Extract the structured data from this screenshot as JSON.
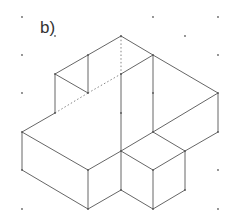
{
  "figure": {
    "label": "b)",
    "colors": {
      "edge": "#555555",
      "hidden_edge": "#777777",
      "grid_dot": "#666666",
      "background": "#ffffff"
    }
  },
  "grid_dots": [
    [
      22,
      17
    ],
    [
      153,
      17
    ],
    [
      218,
      17
    ],
    [
      55,
      36
    ],
    [
      185,
      36
    ],
    [
      22,
      55
    ],
    [
      218,
      55
    ],
    [
      22,
      93
    ],
    [
      218,
      170
    ],
    [
      22,
      209
    ],
    [
      218,
      209
    ]
  ],
  "edges": [
    [
      121,
      36,
      88,
      55
    ],
    [
      88,
      55,
      55,
      74
    ],
    [
      121,
      36,
      153,
      55
    ],
    [
      121,
      74,
      153,
      55
    ],
    [
      55,
      74,
      88,
      93
    ],
    [
      88,
      55,
      88,
      93
    ],
    [
      55,
      74,
      55,
      113
    ],
    [
      121,
      74,
      121,
      151
    ],
    [
      153,
      55,
      153,
      132
    ],
    [
      153,
      55,
      218,
      93
    ],
    [
      218,
      93,
      218,
      132
    ],
    [
      153,
      132,
      218,
      93
    ],
    [
      218,
      132,
      185,
      151
    ],
    [
      55,
      113,
      22,
      132
    ],
    [
      22,
      132,
      88,
      170
    ],
    [
      88,
      170,
      121,
      151
    ],
    [
      22,
      132,
      22,
      170
    ],
    [
      22,
      170,
      88,
      209
    ],
    [
      88,
      170,
      88,
      209
    ],
    [
      88,
      209,
      121,
      190
    ],
    [
      121,
      190,
      121,
      151
    ],
    [
      121,
      151,
      153,
      132
    ],
    [
      121,
      151,
      153,
      170
    ],
    [
      153,
      170,
      185,
      151
    ],
    [
      153,
      132,
      185,
      151
    ],
    [
      153,
      170,
      153,
      209
    ],
    [
      121,
      190,
      153,
      209
    ],
    [
      153,
      209,
      185,
      190
    ],
    [
      185,
      190,
      185,
      151
    ]
  ],
  "hidden_edges": [
    [
      121,
      36,
      121,
      74
    ],
    [
      55,
      113,
      88,
      93
    ],
    [
      88,
      93,
      121,
      74
    ]
  ],
  "vertices": [
    [
      121,
      36
    ],
    [
      88,
      55
    ],
    [
      153,
      55
    ],
    [
      55,
      74
    ],
    [
      121,
      74
    ],
    [
      88,
      93
    ],
    [
      153,
      93
    ],
    [
      218,
      93
    ],
    [
      55,
      113
    ],
    [
      121,
      113
    ],
    [
      22,
      132
    ],
    [
      153,
      132
    ],
    [
      218,
      132
    ],
    [
      121,
      151
    ],
    [
      185,
      151
    ],
    [
      22,
      170
    ],
    [
      88,
      170
    ],
    [
      153,
      170
    ],
    [
      121,
      190
    ],
    [
      185,
      190
    ],
    [
      88,
      209
    ],
    [
      153,
      209
    ]
  ]
}
